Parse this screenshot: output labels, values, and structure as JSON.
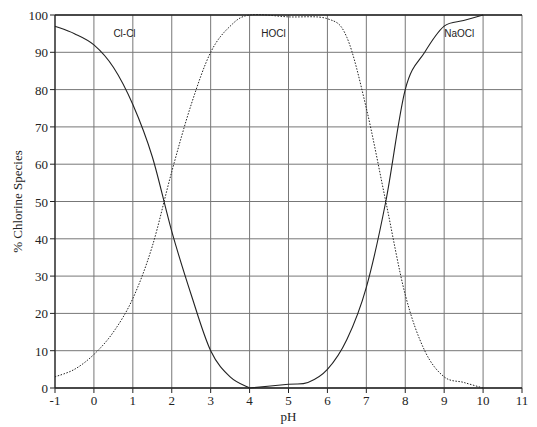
{
  "chart_data": {
    "type": "line",
    "title": "",
    "xlabel": "pH",
    "ylabel": "% Chlorine Species",
    "xlim": [
      -1,
      11
    ],
    "ylim": [
      0,
      100
    ],
    "xticks": [
      -1,
      0,
      1,
      2,
      3,
      4,
      5,
      6,
      7,
      8,
      9,
      10,
      11
    ],
    "yticks": [
      0,
      10,
      20,
      30,
      40,
      50,
      60,
      70,
      80,
      90,
      100
    ],
    "grid": true,
    "legend": "inline labels",
    "series": [
      {
        "name": "Cl-Cl",
        "style": "solid",
        "x": [
          -1,
          -0.5,
          0,
          0.5,
          1,
          1.5,
          2,
          2.5,
          3,
          3.5,
          4
        ],
        "y": [
          97,
          95,
          92,
          86,
          76,
          62,
          42,
          25,
          10,
          3,
          0
        ]
      },
      {
        "name": "HOCl",
        "style": "dotted",
        "x": [
          -1,
          -0.5,
          0,
          0.5,
          1,
          1.5,
          2,
          2.5,
          3,
          3.5,
          4,
          5,
          6,
          6.5,
          7,
          7.5,
          8,
          8.5,
          9,
          9.5,
          10
        ],
        "y": [
          3,
          5,
          9,
          15,
          24,
          38,
          58,
          76,
          90,
          97,
          100,
          99.5,
          99,
          94,
          75,
          50,
          25,
          10,
          3,
          1.5,
          0
        ]
      },
      {
        "name": "NaOCl",
        "style": "solid",
        "x": [
          4,
          5,
          5.5,
          6,
          6.5,
          7,
          7.5,
          8,
          8.5,
          9,
          9.5,
          10
        ],
        "y": [
          0,
          1,
          1.5,
          5,
          13,
          27,
          50,
          80,
          90,
          97,
          98.5,
          100
        ]
      }
    ],
    "annotations": [
      {
        "text": "Cl-Cl",
        "x": 0.5,
        "y": 94
      },
      {
        "text": "HOCl",
        "x": 4.3,
        "y": 94
      },
      {
        "text": "NaOCl",
        "x": 9,
        "y": 94
      }
    ]
  }
}
